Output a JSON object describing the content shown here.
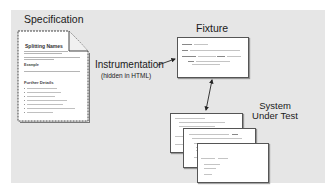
{
  "diagram": {
    "labels": {
      "specification": "Specification",
      "fixture": "Fixture",
      "instrumentation": "Instrumentation",
      "instrumentation_note": "(hidden in HTML)",
      "system_under_test_line1": "System",
      "system_under_test_line2": "Under Test"
    },
    "specification_document": {
      "title": "Splitting Names",
      "section_example": "Example",
      "section_further": "Further Details"
    },
    "colors": {
      "panel_background": "#e6e6e6",
      "page_background": "#ffffff",
      "page_border": "#555555",
      "text": "#1a1a1a",
      "arrow": "#222222"
    },
    "connections": [
      {
        "from": "Instrumentation",
        "to": "Fixture",
        "type": "single-arrow"
      },
      {
        "from": "Fixture",
        "to": "System Under Test",
        "type": "double-arrow"
      }
    ]
  }
}
